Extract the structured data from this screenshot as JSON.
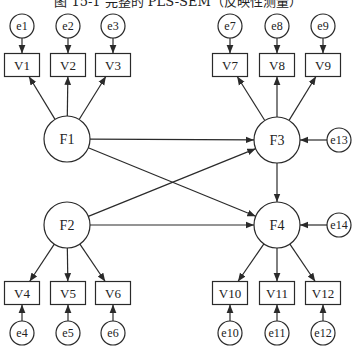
{
  "title": "图 15-1   完整的 PLS-SEM（反映性测量）",
  "colors": {
    "stroke": "#2a2a2a",
    "fill": "#ffffff",
    "text": "#222222"
  },
  "latent": [
    {
      "id": "F1",
      "label": "F1",
      "cx": 67,
      "cy": 139,
      "r": 23
    },
    {
      "id": "F2",
      "label": "F2",
      "cx": 67,
      "cy": 225,
      "r": 23
    },
    {
      "id": "F3",
      "label": "F3",
      "cx": 277,
      "cy": 140,
      "r": 23
    },
    {
      "id": "F4",
      "label": "F4",
      "cx": 277,
      "cy": 225,
      "r": 23
    }
  ],
  "indicators": [
    {
      "id": "V1",
      "label": "V1",
      "cx": 22,
      "cy": 65,
      "factor": "F1"
    },
    {
      "id": "V2",
      "label": "V2",
      "cx": 68,
      "cy": 65,
      "factor": "F1"
    },
    {
      "id": "V3",
      "label": "V3",
      "cx": 113,
      "cy": 65,
      "factor": "F1"
    },
    {
      "id": "V4",
      "label": "V4",
      "cx": 22,
      "cy": 293,
      "factor": "F2"
    },
    {
      "id": "V5",
      "label": "V5",
      "cx": 68,
      "cy": 293,
      "factor": "F2"
    },
    {
      "id": "V6",
      "label": "V6",
      "cx": 113,
      "cy": 293,
      "factor": "F2"
    },
    {
      "id": "V7",
      "label": "V7",
      "cx": 230,
      "cy": 65,
      "factor": "F3"
    },
    {
      "id": "V8",
      "label": "V8",
      "cx": 277,
      "cy": 65,
      "factor": "F3"
    },
    {
      "id": "V9",
      "label": "V9",
      "cx": 323,
      "cy": 65,
      "factor": "F3"
    },
    {
      "id": "V10",
      "label": "V10",
      "cx": 230,
      "cy": 293,
      "factor": "F4"
    },
    {
      "id": "V11",
      "label": "V11",
      "cx": 277,
      "cy": 293,
      "factor": "F4"
    },
    {
      "id": "V12",
      "label": "V12",
      "cx": 323,
      "cy": 293,
      "factor": "F4"
    }
  ],
  "errors": [
    {
      "id": "e1",
      "label": "e1",
      "cx": 22,
      "cy": 26,
      "target": "V1"
    },
    {
      "id": "e2",
      "label": "e2",
      "cx": 68,
      "cy": 26,
      "target": "V2"
    },
    {
      "id": "e3",
      "label": "e3",
      "cx": 113,
      "cy": 26,
      "target": "V3"
    },
    {
      "id": "e4",
      "label": "e4",
      "cx": 22,
      "cy": 333,
      "target": "V4"
    },
    {
      "id": "e5",
      "label": "e5",
      "cx": 68,
      "cy": 333,
      "target": "V5"
    },
    {
      "id": "e6",
      "label": "e6",
      "cx": 113,
      "cy": 333,
      "target": "V6"
    },
    {
      "id": "e7",
      "label": "e7",
      "cx": 230,
      "cy": 26,
      "target": "V7"
    },
    {
      "id": "e8",
      "label": "e8",
      "cx": 277,
      "cy": 26,
      "target": "V8"
    },
    {
      "id": "e9",
      "label": "e9",
      "cx": 323,
      "cy": 26,
      "target": "V9"
    },
    {
      "id": "e10",
      "label": "e10",
      "cx": 230,
      "cy": 333,
      "target": "V10"
    },
    {
      "id": "e11",
      "label": "e11",
      "cx": 277,
      "cy": 333,
      "target": "V11"
    },
    {
      "id": "e12",
      "label": "e12",
      "cx": 323,
      "cy": 333,
      "target": "V12"
    },
    {
      "id": "e13",
      "label": "e13",
      "cx": 339,
      "cy": 140,
      "target": "F3"
    },
    {
      "id": "e14",
      "label": "e14",
      "cx": 339,
      "cy": 225,
      "target": "F4"
    }
  ],
  "paths": [
    {
      "from": "F1",
      "to": "F3"
    },
    {
      "from": "F1",
      "to": "F4"
    },
    {
      "from": "F2",
      "to": "F3"
    },
    {
      "from": "F2",
      "to": "F4"
    },
    {
      "from": "F3",
      "to": "F4"
    }
  ],
  "sizes": {
    "box_w": 35,
    "box_h": 23,
    "err_r": 12
  }
}
